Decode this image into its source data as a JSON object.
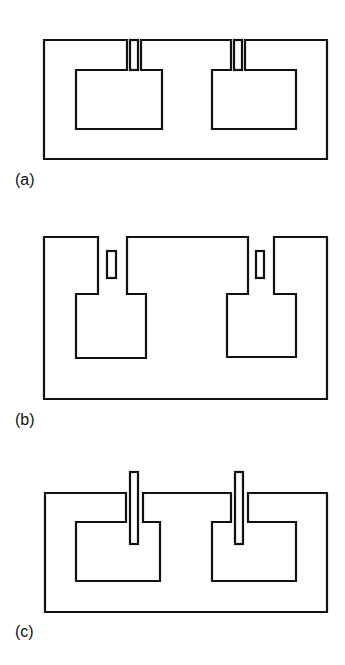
{
  "figure": {
    "panels": [
      {
        "id": "a",
        "label": "(a)",
        "description": "Outer rectangular core with two inner windows; narrow slot inserts in top gaps"
      },
      {
        "id": "b",
        "label": "(b)",
        "description": "Core with stepped inner windows and small floating slots in gaps"
      },
      {
        "id": "c",
        "label": "(c)",
        "description": "Core with inner windows and long bars passing through top gaps"
      }
    ],
    "stroke_color": "#111111",
    "background": "#ffffff"
  }
}
